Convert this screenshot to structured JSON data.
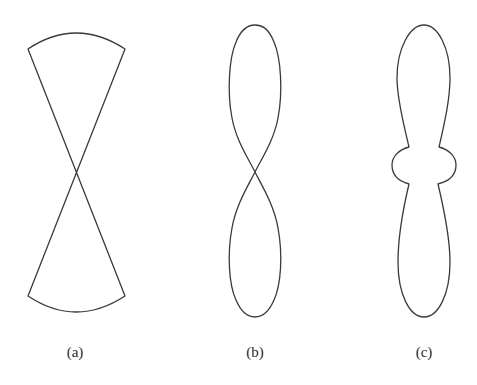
{
  "figure": {
    "panels": [
      {
        "id": "a",
        "label": "(a)",
        "description": "Two circular sectors meeting at a common apex (bow-tie / fan beam pattern)"
      },
      {
        "id": "b",
        "label": "(b)",
        "description": "Figure-eight pattern with two elongated lobes crossing at center"
      },
      {
        "id": "c",
        "label": "(c)",
        "description": "Two elongated lobes joined by a central body with small side bulges"
      }
    ],
    "stroke_color": "#3a3a3a",
    "background": "#ffffff"
  }
}
